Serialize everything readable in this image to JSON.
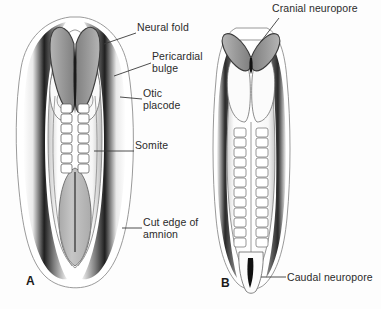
{
  "figure": {
    "background_color": "#fdfdfd",
    "text_color": "#2b2b2b",
    "leader_line_color": "#3a3a3a",
    "neural_fold_color": "#9a9a9a",
    "yolk_sac_color": "#b9b9b9"
  },
  "panels": [
    {
      "letter": "A",
      "x": 26,
      "y": 280
    },
    {
      "letter": "B",
      "x": 221,
      "y": 282
    }
  ],
  "labels": {
    "neural_fold": "Neural fold",
    "pericardial_bulge": "Pericardial\nbulge",
    "otic_placode": "Otic\nplacode",
    "somite": "Somite",
    "cut_edge_of_amnion": "Cut edge of\namnion",
    "cranial_neuropore": "Cranial neuropore",
    "caudal_neuropore": "Caudal neuropore"
  },
  "label_positions": {
    "neural_fold": {
      "x": 137,
      "y": 27
    },
    "pericardial_bulge": {
      "x": 152,
      "y": 56
    },
    "otic_placode": {
      "x": 143,
      "y": 93
    },
    "somite": {
      "x": 135,
      "y": 145
    },
    "cut_edge_of_amnion": {
      "x": 143,
      "y": 222
    },
    "cranial_neuropore": {
      "x": 272,
      "y": 6
    },
    "caudal_neuropore": {
      "x": 287,
      "y": 272
    }
  },
  "leader_lines": [
    {
      "name": "neural-fold-leader",
      "x1": 136,
      "y1": 33,
      "x2": 104,
      "y2": 44
    },
    {
      "name": "pericardial-bulge-leader",
      "x1": 151,
      "y1": 63,
      "x2": 114,
      "y2": 76
    },
    {
      "name": "otic-placode-leader",
      "x1": 142,
      "y1": 99,
      "x2": 120,
      "y2": 97
    },
    {
      "name": "somite-leader",
      "x1": 134,
      "y1": 151,
      "x2": 94,
      "y2": 151
    },
    {
      "name": "cut-edge-amnion-leader",
      "x1": 142,
      "y1": 228,
      "x2": 122,
      "y2": 228
    },
    {
      "name": "cranial-neuropore-leader",
      "x1": 279,
      "y1": 18,
      "x2": 259,
      "y2": 44
    },
    {
      "name": "caudal-neuropore-leader",
      "x1": 286,
      "y1": 277,
      "x2": 261,
      "y2": 277
    }
  ],
  "embryo_a": {
    "name": "embryo-day-22-dorsal-view",
    "structures": [
      "amnion cut edge",
      "neural folds",
      "pericardial bulge",
      "otic placode",
      "somites",
      "yolk sac"
    ]
  },
  "embryo_b": {
    "name": "embryo-day-23-dorsal-view",
    "structures": [
      "cranial neuropore",
      "neural folds",
      "somites",
      "caudal neuropore"
    ]
  }
}
